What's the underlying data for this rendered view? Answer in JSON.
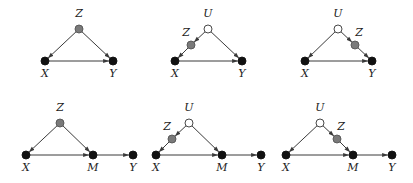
{
  "colors": {
    "observed": "#111111",
    "proxy": "#7a7a7a",
    "unobserved_fill": "#ffffff",
    "edge": "#3a3a3a"
  },
  "diagrams": [
    {
      "id": "d1",
      "nodes": [
        {
          "id": "Z",
          "label": "Z",
          "x": 79,
          "y": 29,
          "type": "proxy",
          "lx": 79,
          "ly": 17
        },
        {
          "id": "X",
          "label": "X",
          "x": 45,
          "y": 61,
          "type": "observed",
          "lx": 45,
          "ly": 77
        },
        {
          "id": "Y",
          "label": "Y",
          "x": 113,
          "y": 61,
          "type": "observed",
          "lx": 113,
          "ly": 77
        }
      ],
      "edges": [
        [
          "Z",
          "X"
        ],
        [
          "Z",
          "Y"
        ],
        [
          "X",
          "Y"
        ]
      ]
    },
    {
      "id": "d2",
      "nodes": [
        {
          "id": "U",
          "label": "U",
          "x": 208,
          "y": 29,
          "type": "unobserved",
          "lx": 208,
          "ly": 17
        },
        {
          "id": "Z",
          "label": "Z",
          "x": 191,
          "y": 45,
          "type": "proxy",
          "lx": 186,
          "ly": 36
        },
        {
          "id": "X",
          "label": "X",
          "x": 175,
          "y": 61,
          "type": "observed",
          "lx": 175,
          "ly": 77
        },
        {
          "id": "Y",
          "label": "Y",
          "x": 242,
          "y": 61,
          "type": "observed",
          "lx": 242,
          "ly": 77
        }
      ],
      "edges": [
        [
          "U",
          "Z"
        ],
        [
          "Z",
          "X"
        ],
        [
          "U",
          "Y"
        ],
        [
          "X",
          "Y"
        ]
      ]
    },
    {
      "id": "d3",
      "nodes": [
        {
          "id": "U",
          "label": "U",
          "x": 338,
          "y": 29,
          "type": "unobserved",
          "lx": 338,
          "ly": 17
        },
        {
          "id": "Z",
          "label": "Z",
          "x": 355,
          "y": 45,
          "type": "proxy",
          "lx": 359,
          "ly": 36
        },
        {
          "id": "X",
          "label": "X",
          "x": 305,
          "y": 61,
          "type": "observed",
          "lx": 305,
          "ly": 77
        },
        {
          "id": "Y",
          "label": "Y",
          "x": 372,
          "y": 61,
          "type": "observed",
          "lx": 372,
          "ly": 77
        }
      ],
      "edges": [
        [
          "U",
          "X"
        ],
        [
          "U",
          "Z"
        ],
        [
          "Z",
          "Y"
        ],
        [
          "X",
          "Y"
        ]
      ]
    },
    {
      "id": "d4",
      "nodes": [
        {
          "id": "Z",
          "label": "Z",
          "x": 60,
          "y": 123,
          "type": "proxy",
          "lx": 60,
          "ly": 111
        },
        {
          "id": "X",
          "label": "X",
          "x": 26,
          "y": 155,
          "type": "observed",
          "lx": 26,
          "ly": 171
        },
        {
          "id": "M",
          "label": "M",
          "x": 93,
          "y": 155,
          "type": "observed",
          "lx": 93,
          "ly": 171
        },
        {
          "id": "Y",
          "label": "Y",
          "x": 133,
          "y": 155,
          "type": "observed",
          "lx": 133,
          "ly": 171
        }
      ],
      "edges": [
        [
          "Z",
          "X"
        ],
        [
          "Z",
          "M"
        ],
        [
          "X",
          "M"
        ],
        [
          "M",
          "Y"
        ]
      ]
    },
    {
      "id": "d5",
      "nodes": [
        {
          "id": "U",
          "label": "U",
          "x": 189,
          "y": 123,
          "type": "unobserved",
          "lx": 189,
          "ly": 111
        },
        {
          "id": "Z",
          "label": "Z",
          "x": 172,
          "y": 139,
          "type": "proxy",
          "lx": 167,
          "ly": 130
        },
        {
          "id": "X",
          "label": "X",
          "x": 156,
          "y": 155,
          "type": "observed",
          "lx": 156,
          "ly": 171
        },
        {
          "id": "M",
          "label": "M",
          "x": 222,
          "y": 155,
          "type": "observed",
          "lx": 222,
          "ly": 171
        },
        {
          "id": "Y",
          "label": "Y",
          "x": 261,
          "y": 155,
          "type": "observed",
          "lx": 261,
          "ly": 171
        }
      ],
      "edges": [
        [
          "U",
          "Z"
        ],
        [
          "Z",
          "X"
        ],
        [
          "U",
          "M"
        ],
        [
          "X",
          "M"
        ],
        [
          "M",
          "Y"
        ]
      ]
    },
    {
      "id": "d6",
      "nodes": [
        {
          "id": "U",
          "label": "U",
          "x": 320,
          "y": 123,
          "type": "unobserved",
          "lx": 320,
          "ly": 111
        },
        {
          "id": "Z",
          "label": "Z",
          "x": 337,
          "y": 139,
          "type": "proxy",
          "lx": 341,
          "ly": 130
        },
        {
          "id": "X",
          "label": "X",
          "x": 286,
          "y": 155,
          "type": "observed",
          "lx": 286,
          "ly": 171
        },
        {
          "id": "M",
          "label": "M",
          "x": 353,
          "y": 155,
          "type": "observed",
          "lx": 353,
          "ly": 171
        },
        {
          "id": "Y",
          "label": "Y",
          "x": 392,
          "y": 155,
          "type": "observed",
          "lx": 392,
          "ly": 171
        }
      ],
      "edges": [
        [
          "U",
          "X"
        ],
        [
          "U",
          "Z"
        ],
        [
          "Z",
          "M"
        ],
        [
          "X",
          "M"
        ],
        [
          "M",
          "Y"
        ]
      ]
    }
  ]
}
